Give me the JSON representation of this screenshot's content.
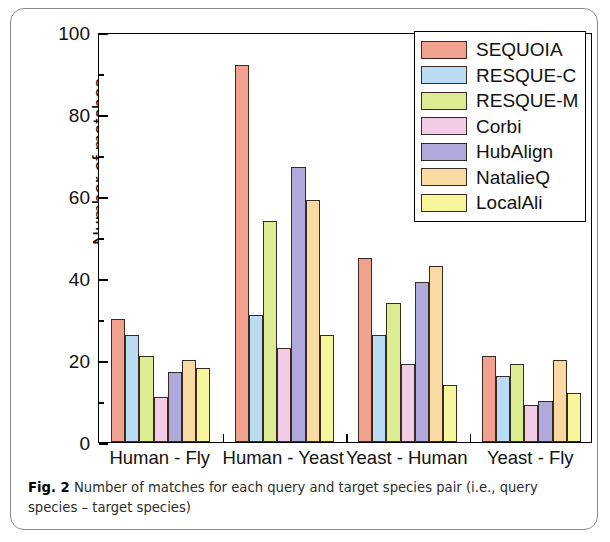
{
  "figure": {
    "caption_label": "Fig. 2",
    "caption_text": " Number of matches for each query and target species pair (i.e., query species – target species)"
  },
  "chart_data": {
    "type": "bar",
    "title": "",
    "xlabel": "",
    "ylabel": "Number of matches",
    "ylim": [
      0,
      100
    ],
    "ytick_labels": [
      "0",
      "20",
      "40",
      "60",
      "80",
      "100"
    ],
    "ytick_values": [
      0,
      20,
      40,
      60,
      80,
      100
    ],
    "yminor_values": [
      10,
      30,
      50,
      70,
      90
    ],
    "grid": false,
    "legend_position": "top-right",
    "categories": [
      "Human - Fly",
      "Human - Yeast",
      "Yeast - Human",
      "Yeast - Fly"
    ],
    "series": [
      {
        "name": "SEQUOIA",
        "color": "#f0a28e",
        "values": [
          30,
          92,
          45,
          21
        ]
      },
      {
        "name": "RESQUE-C",
        "color": "#b9dcf2",
        "values": [
          26,
          31,
          26,
          16
        ]
      },
      {
        "name": "RESQUE-M",
        "color": "#dcec92",
        "values": [
          21,
          54,
          34,
          19
        ]
      },
      {
        "name": "Corbi",
        "color": "#f2cbe6",
        "values": [
          11,
          23,
          19,
          9
        ]
      },
      {
        "name": "HubAlign",
        "color": "#b0a9dc",
        "values": [
          17,
          67,
          39,
          10
        ]
      },
      {
        "name": "NatalieQ",
        "color": "#f9daa2",
        "values": [
          20,
          59,
          43,
          20
        ]
      },
      {
        "name": "LocalAli",
        "color": "#f8f69c",
        "values": [
          18,
          26,
          14,
          12
        ]
      }
    ]
  }
}
